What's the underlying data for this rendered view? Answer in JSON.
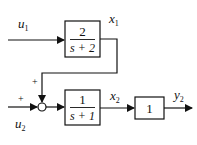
{
  "diagram": {
    "type": "block-diagram",
    "signals": {
      "u1": {
        "base": "u",
        "sub": "1"
      },
      "u2": {
        "base": "u",
        "sub": "2"
      },
      "x1": {
        "base": "x",
        "sub": "1"
      },
      "x2": {
        "base": "x",
        "sub": "2"
      },
      "y2": {
        "base": "y",
        "sub": "2"
      }
    },
    "blocks": [
      {
        "id": "G1",
        "numerator": "2",
        "denominator": "s + 2"
      },
      {
        "id": "G2",
        "numerator": "1",
        "denominator": "s + 1"
      },
      {
        "id": "G3",
        "gain": "1"
      }
    ],
    "summing_junction": {
      "top_sign": "+",
      "left_sign": "+"
    },
    "connections": [
      "u1 -> G1",
      "G1 -> x1 -> summing_junction (top, +)",
      "u2 -> summing_junction (left, +)",
      "summing_junction -> G2",
      "G2 -> x2 -> G3",
      "G3 -> y2"
    ]
  }
}
